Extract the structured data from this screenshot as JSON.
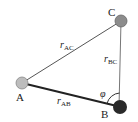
{
  "diagram": {
    "title": "",
    "nodes": [
      {
        "id": "A",
        "label": "A",
        "x": 22,
        "y": 83,
        "r": 6,
        "fill": "#bdbdbd"
      },
      {
        "id": "B",
        "label": "B",
        "x": 121,
        "y": 107,
        "r": 7,
        "fill": "#2a2a2a"
      },
      {
        "id": "C",
        "label": "C",
        "x": 121,
        "y": 21,
        "r": 6,
        "fill": "#8c8c8c"
      }
    ],
    "edges": [
      {
        "from": "A",
        "to": "C",
        "label_main": "r",
        "label_sub": "AC"
      },
      {
        "from": "C",
        "to": "B",
        "label_main": "r",
        "label_sub": "BC"
      },
      {
        "from": "A",
        "to": "B",
        "label_main": "r",
        "label_sub": "AB"
      }
    ],
    "angle": {
      "at": "B",
      "symbol": "φ"
    }
  }
}
